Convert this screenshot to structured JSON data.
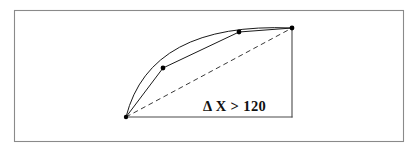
{
  "figure": {
    "title": "",
    "label_text": "Δ X > 120",
    "label_parts": {
      "symbol": "Δ",
      "variable": "X",
      "operator": ">",
      "threshold": "120"
    },
    "colors": {
      "frame_stroke": "#8a8a8a",
      "axis_stroke": "#4a4a4a",
      "curve_stroke": "#1a1a1a",
      "chord_stroke": "#3a3a3a",
      "node_fill": "#000000",
      "background": "#ffffff"
    },
    "frame": {
      "x": 14,
      "y": 10,
      "width": 390,
      "height": 132
    },
    "axes": {
      "origin_x": 126,
      "origin_y": 117,
      "baseline_end_x": 292,
      "vertical_top_y": 28
    },
    "curve": {
      "type": "arc",
      "start": [
        126,
        117
      ],
      "end": [
        292,
        28
      ],
      "control": [
        150,
        22
      ],
      "description": "smooth concave-down arc from origin to upper right"
    },
    "polyline": {
      "description": "three-segment chordal approximation of the arc",
      "points": [
        [
          126,
          117
        ],
        [
          163,
          68
        ],
        [
          239,
          32
        ],
        [
          292,
          28
        ]
      ]
    },
    "chord": {
      "description": "dashed straight chord from origin to arc endpoint",
      "start": [
        126,
        117
      ],
      "end": [
        292,
        28
      ]
    },
    "nodes": [
      {
        "name": "origin-node",
        "x": 126,
        "y": 117,
        "r": 2.2
      },
      {
        "name": "interior-node-1",
        "x": 163,
        "y": 68,
        "r": 2.4
      },
      {
        "name": "interior-node-2",
        "x": 239,
        "y": 32,
        "r": 2.4
      },
      {
        "name": "endpoint-node",
        "x": 292,
        "y": 28,
        "r": 2.4
      }
    ],
    "label_position": {
      "x": 203,
      "y": 111
    }
  }
}
